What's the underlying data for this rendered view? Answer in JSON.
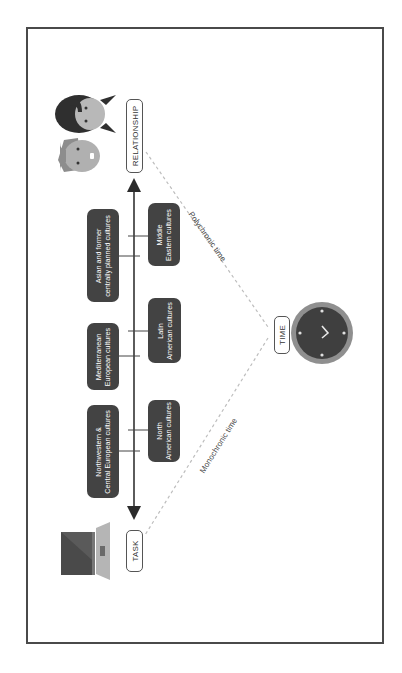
{
  "diagram": {
    "orientation": "rotated 90deg counter-clockwise",
    "axis": {
      "start_label": "TASK",
      "end_label": "RELATIONSHIP",
      "apex_label": "TIME"
    },
    "time_types": {
      "monochronic": "Monochronic time",
      "polychronic": "Polychronic time"
    },
    "cultures_upper_row": [
      {
        "line1": "Northwestern &",
        "line2": "Central European cultures"
      },
      {
        "line1": "Mediterranean",
        "line2": "European cultures"
      },
      {
        "line1": "Asian and former",
        "line2": "centrally planned cultures"
      }
    ],
    "cultures_lower_row": [
      {
        "line1": "North",
        "line2": "American cultures"
      },
      {
        "line1": "Latin",
        "line2": "American cultures"
      },
      {
        "line1": "Middle",
        "line2": "Eastern cultures"
      }
    ],
    "icons": {
      "task": "laptop-icon",
      "relationship": "two-faces-icon",
      "time": "clock-icon"
    },
    "colors": {
      "box_fill": "#434343",
      "frame": "#4a4a4a",
      "dashed_line": "#bdbdbd",
      "clock_ring": "#8a8a8a",
      "clock_face": "#3f3f3f"
    }
  }
}
